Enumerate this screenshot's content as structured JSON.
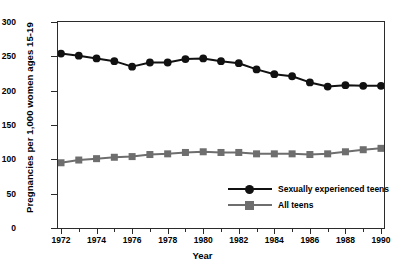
{
  "chart_data": {
    "type": "line",
    "title": "",
    "xlabel": "Year",
    "ylabel": "Pregnancies per 1,000 women ages 15-19",
    "x": [
      1972,
      1973,
      1974,
      1975,
      1976,
      1977,
      1978,
      1979,
      1980,
      1981,
      1982,
      1983,
      1984,
      1985,
      1986,
      1987,
      1988,
      1989,
      1990
    ],
    "xlim": [
      1972,
      1990
    ],
    "ylim": [
      0,
      300
    ],
    "yticks": [
      0,
      50,
      100,
      150,
      200,
      250,
      300
    ],
    "xticks_major": [
      1972,
      1974,
      1976,
      1978,
      1980,
      1982,
      1984,
      1986,
      1988,
      1990
    ],
    "xticks_minor": [
      1973,
      1975,
      1977,
      1979,
      1981,
      1983,
      1985,
      1987,
      1989
    ],
    "grid": false,
    "legend_position": "lower-right-inside",
    "series": [
      {
        "name": "Sexually experienced teens",
        "color": "#111111",
        "marker": "circle",
        "values": [
          254,
          251,
          247,
          243,
          235,
          241,
          241,
          246,
          247,
          243,
          240,
          231,
          224,
          221,
          212,
          206,
          208,
          207,
          207
        ]
      },
      {
        "name": "All teens",
        "color": "#6e6e6e",
        "marker": "square",
        "values": [
          95,
          99,
          101,
          103,
          104,
          107,
          108,
          110,
          111,
          110,
          110,
          108,
          108,
          108,
          107,
          108,
          111,
          114,
          116
        ]
      }
    ]
  },
  "axis": {
    "y_tick_labels": [
      "0",
      "50",
      "100",
      "150",
      "200",
      "250",
      "300"
    ],
    "x_tick_labels": [
      "1972",
      "1974",
      "1976",
      "1978",
      "1980",
      "1982",
      "1984",
      "1986",
      "1988",
      "1990"
    ],
    "x_title": "Year",
    "y_title": "Pregnancies per 1,000 women ages 15-19"
  },
  "legend": {
    "entries": [
      {
        "label": "Sexually experienced teens",
        "color": "#111111",
        "marker": "circle"
      },
      {
        "label": "All teens",
        "color": "#6e6e6e",
        "marker": "square"
      }
    ]
  }
}
